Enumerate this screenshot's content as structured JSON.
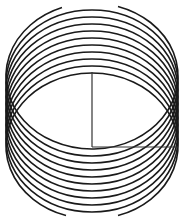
{
  "figure": {
    "title": "",
    "stroke_color": "#1a1a1a",
    "line_color": "#333333",
    "background": "#ffffff",
    "ellipses": {
      "count": 11,
      "cx": 92,
      "rx": 86,
      "ry": 73,
      "cy_start": 76,
      "cy_step": 7
    },
    "vertical_line": {
      "x": 92,
      "y1": 72,
      "y2": 147
    },
    "horizontal_line": {
      "x1": 92,
      "x2": 178,
      "y": 147
    },
    "top_gap": {
      "x1": 62,
      "x2": 118
    },
    "bottom_gap": {
      "x1": 66,
      "x2": 118
    }
  }
}
